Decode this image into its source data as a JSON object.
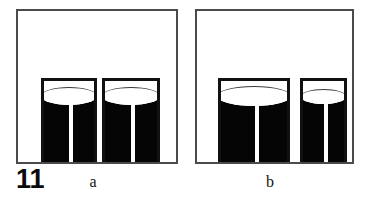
{
  "figure": {
    "number_label": "11",
    "background_color": "#ffffff",
    "frame_color": "#4b4b4b",
    "glass_outline_color": "#111111",
    "liquid_color": "#050505",
    "straw_color": "#ffffff",
    "width_px": 370,
    "height_px": 203
  },
  "panels": [
    {
      "id": "a",
      "caption": "a",
      "frame": {
        "x": 16,
        "y": 9,
        "width": 162,
        "height": 155
      },
      "glasses": [
        {
          "name": "glass-a-left",
          "x": 23,
          "width": 56,
          "height": 84,
          "liquid_height": 66,
          "meniscus_height": 18,
          "straw_width": 4,
          "straw_height": 64,
          "straw_offset": 25
        },
        {
          "name": "glass-a-right",
          "x": 84,
          "width": 58,
          "height": 84,
          "liquid_height": 66,
          "meniscus_height": 18,
          "straw_width": 4,
          "straw_height": 64,
          "straw_offset": 26
        }
      ]
    },
    {
      "id": "b",
      "caption": "b",
      "frame": {
        "x": 195,
        "y": 9,
        "width": 159,
        "height": 155
      },
      "glasses": [
        {
          "name": "glass-b-left",
          "x": 21,
          "width": 72,
          "height": 84,
          "liquid_height": 66,
          "meniscus_height": 20,
          "straw_width": 4,
          "straw_height": 64,
          "straw_offset": 34
        },
        {
          "name": "glass-b-right",
          "x": 103,
          "width": 47,
          "height": 84,
          "liquid_height": 66,
          "meniscus_height": 15,
          "straw_width": 4,
          "straw_height": 64,
          "straw_offset": 21
        }
      ]
    }
  ]
}
